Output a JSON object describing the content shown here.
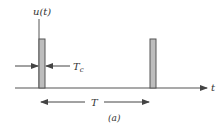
{
  "diagram": {
    "y_axis_label": "u(t)",
    "x_axis_label": "t",
    "pulse_width_label_main": "T",
    "pulse_width_label_sub": "c",
    "period_label": "T",
    "caption": "(a)",
    "pulse_count": 2,
    "colors": {
      "line": "#555555",
      "pulse_fill": "#bdbdbd",
      "pulse_stroke": "#555555",
      "text": "#333333"
    }
  }
}
